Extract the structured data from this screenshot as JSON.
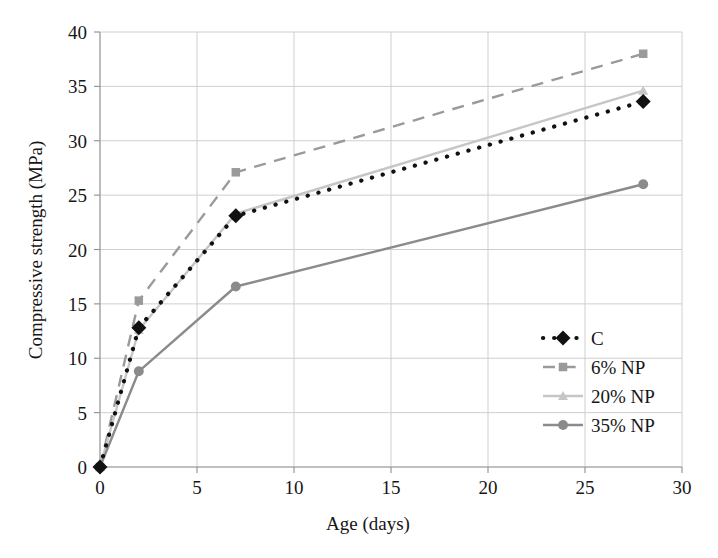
{
  "chart_data": {
    "type": "line",
    "title": "",
    "xlabel": "Age (days)",
    "ylabel": "Compressive strength (MPa)",
    "xlim": [
      0,
      30
    ],
    "ylim": [
      0,
      40
    ],
    "xticks": [
      0,
      5,
      10,
      15,
      20,
      25,
      30
    ],
    "yticks": [
      0,
      5,
      10,
      15,
      20,
      25,
      30,
      35,
      40
    ],
    "xtick_labels": [
      "0",
      "5",
      "10",
      "15",
      "20",
      "25",
      "30"
    ],
    "ytick_labels": [
      "0",
      "5",
      "10",
      "15",
      "20",
      "25",
      "30",
      "35",
      "40"
    ],
    "grid": true,
    "legend_position": "lower-right",
    "x": [
      0,
      2,
      7,
      28
    ],
    "series": [
      {
        "name": "C",
        "values": [
          0,
          12.8,
          23.1,
          33.6
        ],
        "color": "#111111",
        "line_style": "dotted",
        "marker": "diamond"
      },
      {
        "name": "6% NP",
        "values": [
          0,
          15.3,
          27.1,
          38.0
        ],
        "color": "#9a9a9a",
        "line_style": "dashed",
        "marker": "square"
      },
      {
        "name": "20% NP",
        "values": [
          0,
          12.6,
          23.3,
          34.6
        ],
        "color": "#c6c6c6",
        "line_style": "solid",
        "marker": "triangle"
      },
      {
        "name": "35% NP",
        "values": [
          0,
          8.8,
          16.6,
          26.0
        ],
        "color": "#8b8b8b",
        "line_style": "solid",
        "marker": "circle"
      }
    ]
  },
  "axes": {
    "x_title": "Age (days)",
    "y_title": "Compressive strength (MPa)"
  },
  "legend": {
    "entries": [
      {
        "label": "C"
      },
      {
        "label": "6% NP"
      },
      {
        "label": "20% NP"
      },
      {
        "label": "35% NP"
      }
    ]
  },
  "ticks": {
    "x": [
      "0",
      "5",
      "10",
      "15",
      "20",
      "25",
      "30"
    ],
    "y": [
      "0",
      "5",
      "10",
      "15",
      "20",
      "25",
      "30",
      "35",
      "40"
    ]
  },
  "colors": {
    "control": "#111111",
    "np6": "#9a9a9a",
    "np20": "#c6c6c6",
    "np35": "#8b8b8b",
    "grid": "#cfcfcf",
    "axis": "#9a9a9a",
    "text": "#161616",
    "background": "#ffffff"
  }
}
